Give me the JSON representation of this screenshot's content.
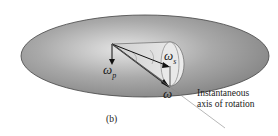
{
  "diagram": {
    "panel_label": "(b)",
    "vectors": {
      "omega_p": {
        "symbol": "ω",
        "subscript": "p"
      },
      "omega_s": {
        "symbol": "ω",
        "subscript": "s"
      },
      "omega": {
        "symbol": "ω",
        "subscript": ""
      }
    },
    "annotation": {
      "line1": "Instantaneous",
      "line2": "axis of rotation"
    },
    "angle_labels": [
      "ψ",
      "φ"
    ]
  }
}
